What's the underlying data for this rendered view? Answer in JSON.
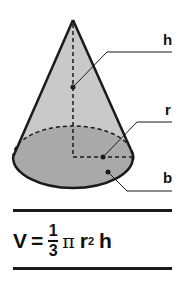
{
  "diagram": {
    "shape": "cone",
    "colors": {
      "surface_fill": "#c9c9c9",
      "base_fill": "#a9a9a9",
      "outline": "#1a1a1a"
    },
    "labels": {
      "height": "h",
      "radius": "r",
      "base": "b"
    }
  },
  "formula": {
    "lhs": "V",
    "equals": "=",
    "numerator": "1",
    "denominator": "3",
    "pi": "π",
    "radius": "r",
    "exponent": "2",
    "height": "h"
  }
}
